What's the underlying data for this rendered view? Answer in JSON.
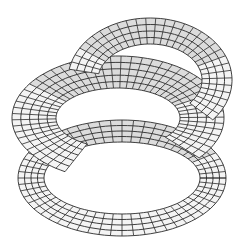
{
  "figure": {
    "title": "",
    "colors": {
      "background": "#ffffff",
      "line": "#2a2a2a",
      "face": "#f4f4f4",
      "shade": "#dcdcdc"
    },
    "bands": [
      {
        "name": "lower-band",
        "cx": 122,
        "cy": 178,
        "rx_out": 104,
        "ry_out": 58,
        "rx_in": 78,
        "ry_in": 36,
        "rings": 4,
        "spokes": 56,
        "start": 0,
        "end": 360
      },
      {
        "name": "middle-band",
        "cx": 118,
        "cy": 118,
        "rx_out": 106,
        "ry_out": 62,
        "rx_in": 62,
        "ry_in": 30,
        "rings": 5,
        "spokes": 48,
        "start": 120,
        "end": 400
      },
      {
        "name": "upper-arch",
        "cx": 150,
        "cy": 80,
        "rx_out": 82,
        "ry_out": 62,
        "rx_in": 52,
        "ry_in": 36,
        "rings": 4,
        "spokes": 30,
        "start": 190,
        "end": 400
      }
    ]
  }
}
